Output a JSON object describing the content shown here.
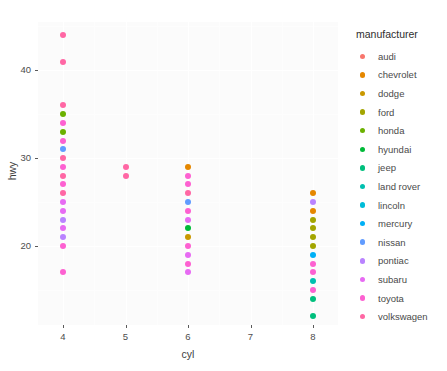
{
  "chart_data": {
    "type": "scatter",
    "title": "",
    "xlabel": "cyl",
    "ylabel": "hwy",
    "xlim": [
      3.6,
      8.4
    ],
    "ylim": [
      11.0,
      45.5
    ],
    "xticks": [
      "4",
      "5",
      "6",
      "7",
      "8"
    ],
    "xtickvals": [
      4,
      5,
      6,
      7,
      8
    ],
    "yticks": [
      "20",
      "30",
      "40"
    ],
    "ytickvals": [
      20,
      30,
      40
    ],
    "grid": true,
    "legend": {
      "title": "manufacturer",
      "position": "right",
      "entries": [
        {
          "label": "audi",
          "color": "#F8766D"
        },
        {
          "label": "chevrolet",
          "color": "#E58700"
        },
        {
          "label": "dodge",
          "color": "#C99800"
        },
        {
          "label": "ford",
          "color": "#A3A500"
        },
        {
          "label": "honda",
          "color": "#6BB100"
        },
        {
          "label": "hyundai",
          "color": "#00BA38"
        },
        {
          "label": "jeep",
          "color": "#00BF7D"
        },
        {
          "label": "land rover",
          "color": "#00C0AF"
        },
        {
          "label": "lincoln",
          "color": "#00BCD8"
        },
        {
          "label": "mercury",
          "color": "#00B0F6"
        },
        {
          "label": "nissan",
          "color": "#619CFF"
        },
        {
          "label": "pontiac",
          "color": "#B983FF"
        },
        {
          "label": "subaru",
          "color": "#E76BF3"
        },
        {
          "label": "toyota",
          "color": "#FD61D1"
        },
        {
          "label": "volkswagen",
          "color": "#FF67A4"
        }
      ]
    },
    "points": [
      {
        "x": 4,
        "y": 44,
        "manufacturer": "volkswagen"
      },
      {
        "x": 4,
        "y": 41,
        "manufacturer": "volkswagen"
      },
      {
        "x": 4,
        "y": 36,
        "manufacturer": "volkswagen"
      },
      {
        "x": 4,
        "y": 35,
        "manufacturer": "honda"
      },
      {
        "x": 4,
        "y": 34,
        "manufacturer": "toyota"
      },
      {
        "x": 4,
        "y": 33,
        "manufacturer": "honda"
      },
      {
        "x": 4,
        "y": 32,
        "manufacturer": "toyota"
      },
      {
        "x": 4,
        "y": 31,
        "manufacturer": "nissan"
      },
      {
        "x": 4,
        "y": 30,
        "manufacturer": "volkswagen"
      },
      {
        "x": 4,
        "y": 29,
        "manufacturer": "toyota"
      },
      {
        "x": 4,
        "y": 28,
        "manufacturer": "volkswagen"
      },
      {
        "x": 4,
        "y": 27,
        "manufacturer": "toyota"
      },
      {
        "x": 4,
        "y": 26,
        "manufacturer": "volkswagen"
      },
      {
        "x": 4,
        "y": 25,
        "manufacturer": "subaru"
      },
      {
        "x": 4,
        "y": 24,
        "manufacturer": "subaru"
      },
      {
        "x": 4,
        "y": 23,
        "manufacturer": "pontiac"
      },
      {
        "x": 4,
        "y": 22,
        "manufacturer": "subaru"
      },
      {
        "x": 4,
        "y": 21,
        "manufacturer": "pontiac"
      },
      {
        "x": 4,
        "y": 20,
        "manufacturer": "toyota"
      },
      {
        "x": 4,
        "y": 17,
        "manufacturer": "toyota"
      },
      {
        "x": 5,
        "y": 29,
        "manufacturer": "volkswagen"
      },
      {
        "x": 5,
        "y": 28,
        "manufacturer": "volkswagen"
      },
      {
        "x": 6,
        "y": 29,
        "manufacturer": "chevrolet"
      },
      {
        "x": 6,
        "y": 28,
        "manufacturer": "toyota"
      },
      {
        "x": 6,
        "y": 27,
        "manufacturer": "toyota"
      },
      {
        "x": 6,
        "y": 26,
        "manufacturer": "volkswagen"
      },
      {
        "x": 6,
        "y": 25,
        "manufacturer": "nissan"
      },
      {
        "x": 6,
        "y": 24,
        "manufacturer": "toyota"
      },
      {
        "x": 6,
        "y": 23,
        "manufacturer": "subaru"
      },
      {
        "x": 6,
        "y": 22,
        "manufacturer": "hyundai"
      },
      {
        "x": 6,
        "y": 21,
        "manufacturer": "dodge"
      },
      {
        "x": 6,
        "y": 20,
        "manufacturer": "toyota"
      },
      {
        "x": 6,
        "y": 19,
        "manufacturer": "subaru"
      },
      {
        "x": 6,
        "y": 18,
        "manufacturer": "toyota"
      },
      {
        "x": 6,
        "y": 17,
        "manufacturer": "subaru"
      },
      {
        "x": 8,
        "y": 26,
        "manufacturer": "chevrolet"
      },
      {
        "x": 8,
        "y": 25,
        "manufacturer": "pontiac"
      },
      {
        "x": 8,
        "y": 24,
        "manufacturer": "chevrolet"
      },
      {
        "x": 8,
        "y": 23,
        "manufacturer": "ford"
      },
      {
        "x": 8,
        "y": 22,
        "manufacturer": "ford"
      },
      {
        "x": 8,
        "y": 21,
        "manufacturer": "ford"
      },
      {
        "x": 8,
        "y": 20,
        "manufacturer": "ford"
      },
      {
        "x": 8,
        "y": 19,
        "manufacturer": "mercury"
      },
      {
        "x": 8,
        "y": 18,
        "manufacturer": "toyota"
      },
      {
        "x": 8,
        "y": 17,
        "manufacturer": "toyota"
      },
      {
        "x": 8,
        "y": 16,
        "manufacturer": "land rover"
      },
      {
        "x": 8,
        "y": 15,
        "manufacturer": "toyota"
      },
      {
        "x": 8,
        "y": 14,
        "manufacturer": "jeep"
      },
      {
        "x": 8,
        "y": 12,
        "manufacturer": "jeep"
      }
    ],
    "minor_xticks": [
      4.5,
      5.5,
      6.5,
      7.5
    ],
    "minor_yticks": [
      15,
      25,
      35,
      40,
      45
    ]
  }
}
